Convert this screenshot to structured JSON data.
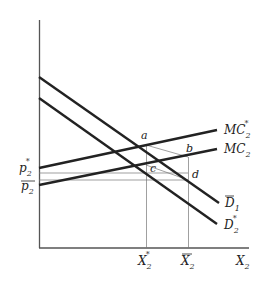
{
  "diagram": {
    "type": "economics supply-demand diagram",
    "axes": {
      "x_label": "X",
      "x_label_sub": "2",
      "y_label": ""
    },
    "curves": [
      {
        "id": "MC2star",
        "label": "MC",
        "sub": "2",
        "sup": "*",
        "kind": "marginal cost (upward sloping, higher)"
      },
      {
        "id": "MC2",
        "label": "MC",
        "sub": "2",
        "sup": "",
        "kind": "marginal cost (upward sloping, lower)"
      },
      {
        "id": "D1bar",
        "label": "D",
        "sub": "1",
        "bar": true,
        "kind": "demand (downward sloping, upper)"
      },
      {
        "id": "D2star",
        "label": "D",
        "sub": "2",
        "sup": "*",
        "kind": "demand (downward sloping, lower)"
      }
    ],
    "y_ticks": [
      {
        "label": "p",
        "sub": "2",
        "sup": "*",
        "bar": false
      },
      {
        "label": "p",
        "sub": "2",
        "sup": "",
        "bar": true
      }
    ],
    "x_ticks": [
      {
        "label": "X",
        "sub": "2",
        "sup": "*",
        "bar": false
      },
      {
        "label": "X",
        "sub": "2",
        "sup": "",
        "bar": true
      }
    ],
    "points": [
      "a",
      "b",
      "c",
      "d"
    ]
  },
  "text": {
    "mc2star": "MC",
    "mc2star_sub": "2",
    "mc2star_sup": "*",
    "mc2": "MC",
    "mc2_sub": "2",
    "d1": "D",
    "d1_sub": "1",
    "d2": "D",
    "d2_sub": "2",
    "d2_sup": "*",
    "p2star": "p",
    "p2star_sub": "2",
    "p2star_sup": "*",
    "p2bar": "p",
    "p2bar_sub": "2",
    "x2star": "X",
    "x2star_sub": "2",
    "x2star_sup": "*",
    "x2bar": "X",
    "x2bar_sub": "2",
    "x2axis": "X",
    "x2axis_sub": "2",
    "pa": "a",
    "pb": "b",
    "pc": "c",
    "pd": "d"
  }
}
